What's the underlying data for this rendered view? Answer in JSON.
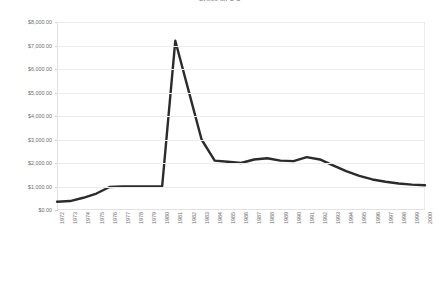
{
  "chart_data": {
    "type": "line",
    "title": "Gross MFG $",
    "xlabel": "",
    "ylabel": "",
    "ylim": [
      0,
      8000
    ],
    "ytick_step": 1000,
    "ytick_labels": [
      "$8,000.00",
      "$7,000.00",
      "$6,000.00",
      "$5,000.00",
      "$4,000.00",
      "$3,000.00",
      "$2,000.00",
      "$1,000.00",
      "$0.00"
    ],
    "ytick_values": [
      8000,
      7000,
      6000,
      5000,
      4000,
      3000,
      2000,
      1000,
      0
    ],
    "grid": true,
    "legend": false,
    "legend_position": "none",
    "line_color": "#2b2b2b",
    "grid_color": "#ededed",
    "background_color": "#ffffff",
    "categories": [
      "1972",
      "1973",
      "1974",
      "1975",
      "1976",
      "1977",
      "1978",
      "1979",
      "1980",
      "1981",
      "1982",
      "1983",
      "1984",
      "1985",
      "1986",
      "1987",
      "1988",
      "1989",
      "1990",
      "1991",
      "1992",
      "1993",
      "1994",
      "1995",
      "1996",
      "1997",
      "1998",
      "1999",
      "2000"
    ],
    "values": [
      350,
      380,
      520,
      700,
      980,
      1000,
      1000,
      1000,
      1000,
      7200,
      5100,
      3000,
      2100,
      2050,
      2000,
      2150,
      2200,
      2100,
      2080,
      2250,
      2150,
      1900,
      1650,
      1450,
      1300,
      1200,
      1130,
      1080,
      1050
    ],
    "series": [
      {
        "name": "Gross MFG $",
        "values": [
          350,
          380,
          520,
          700,
          980,
          1000,
          1000,
          1000,
          1000,
          7200,
          5100,
          3000,
          2100,
          2050,
          2000,
          2150,
          2200,
          2100,
          2080,
          2250,
          2150,
          1900,
          1650,
          1450,
          1300,
          1200,
          1130,
          1080,
          1050
        ]
      }
    ]
  }
}
